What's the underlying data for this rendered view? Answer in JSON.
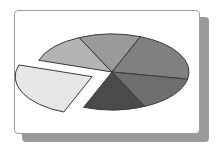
{
  "chart_data": {
    "type": "pie",
    "title": "",
    "style": "3D-ellipse pie, one exploded slice, grayscale",
    "exploded_index": 5,
    "slices": [
      {
        "label": "",
        "value": 13,
        "color": "#b4b4b4"
      },
      {
        "label": "",
        "value": 13,
        "color": "#9a9a9a"
      },
      {
        "label": "",
        "value": 22,
        "color": "#808080"
      },
      {
        "label": "",
        "value": 15,
        "color": "#6e6e6e"
      },
      {
        "label": "",
        "value": 13,
        "color": "#4a4a4a"
      },
      {
        "label": "",
        "value": 24,
        "color": "#e6e6e6"
      }
    ],
    "legend": "none",
    "grid": false
  },
  "colors": {
    "card_bg": "#ffffff",
    "card_border": "#9c9c9c",
    "shadow": "#9a9a9a",
    "slice_outline": "#3a3a3a"
  }
}
